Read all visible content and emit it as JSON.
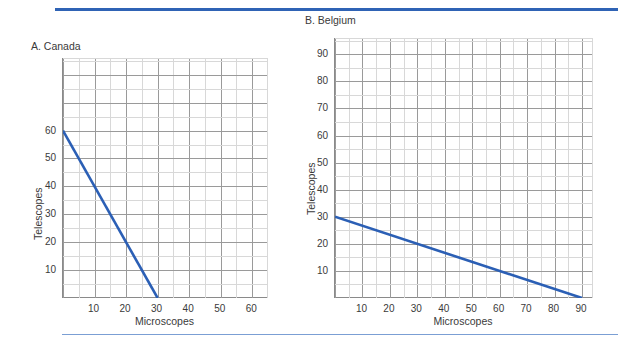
{
  "page": {
    "background": "#ffffff",
    "accent_color": "#2f63b5",
    "rule_light_color": "#7b9fd4",
    "grid_major_color": "#9a9a9a",
    "grid_minor_color": "#d8d8d8",
    "axis_color": "#8a8a8a",
    "text_color": "#3a3a3a"
  },
  "chart_data": [
    {
      "type": "line",
      "id": "panel-a",
      "title": "A. Canada",
      "xlabel": "Microscopes",
      "ylabel": "Telescopes",
      "xlim": [
        0,
        65
      ],
      "ylim": [
        0,
        86
      ],
      "xticks": [
        10,
        20,
        30,
        40,
        50,
        60
      ],
      "yticks": [
        10,
        20,
        30,
        40,
        50,
        60
      ],
      "xtick_labels": [
        "10",
        "20",
        "30",
        "40",
        "50",
        "60"
      ],
      "ytick_labels": [
        "10",
        "20",
        "30",
        "40",
        "50",
        "60"
      ],
      "grid": true,
      "grid_major_step_x": 10,
      "grid_minor_step_x": 5,
      "grid_major_step_y": 10,
      "grid_minor_step_y": 5,
      "legend": "none",
      "series": [
        {
          "name": "Canada PPF",
          "color": "#2b5fb5",
          "x": [
            0,
            30
          ],
          "y": [
            60,
            0
          ]
        }
      ]
    },
    {
      "type": "line",
      "id": "panel-b",
      "title": "B. Belgium",
      "xlabel": "Microscopes",
      "ylabel": "Telescopes",
      "xlim": [
        0,
        94
      ],
      "ylim": [
        0,
        96
      ],
      "xticks": [
        10,
        20,
        30,
        40,
        50,
        60,
        70,
        80,
        90
      ],
      "yticks": [
        10,
        20,
        30,
        40,
        50,
        60,
        70,
        80,
        90
      ],
      "xtick_labels": [
        "10",
        "20",
        "30",
        "40",
        "50",
        "60",
        "70",
        "80",
        "90"
      ],
      "ytick_labels": [
        "10",
        "20",
        "30",
        "40",
        "50",
        "60",
        "70",
        "80",
        "90"
      ],
      "grid": true,
      "grid_major_step_x": 10,
      "grid_minor_step_x": 5,
      "grid_major_step_y": 10,
      "grid_minor_step_y": 5,
      "legend": "none",
      "series": [
        {
          "name": "Belgium PPF",
          "color": "#2b5fb5",
          "x": [
            0,
            90
          ],
          "y": [
            30,
            0
          ]
        }
      ]
    }
  ]
}
